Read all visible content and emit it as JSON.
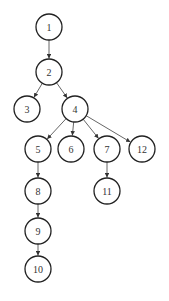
{
  "diagram": {
    "type": "tree",
    "node_radius": 13,
    "colors": {
      "stroke": "#222222",
      "edge": "#555555",
      "text": "#333333",
      "background": "#ffffff"
    },
    "nodes": [
      {
        "id": "1",
        "label": "1",
        "x": 49,
        "y": 27
      },
      {
        "id": "2",
        "label": "2",
        "x": 49,
        "y": 72
      },
      {
        "id": "3",
        "label": "3",
        "x": 27,
        "y": 109
      },
      {
        "id": "4",
        "label": "4",
        "x": 75,
        "y": 109
      },
      {
        "id": "5",
        "label": "5",
        "x": 38,
        "y": 149
      },
      {
        "id": "6",
        "label": "6",
        "x": 71,
        "y": 149
      },
      {
        "id": "7",
        "label": "7",
        "x": 107,
        "y": 149
      },
      {
        "id": "12",
        "label": "12",
        "x": 142,
        "y": 149
      },
      {
        "id": "8",
        "label": "8",
        "x": 38,
        "y": 191
      },
      {
        "id": "11",
        "label": "11",
        "x": 107,
        "y": 191
      },
      {
        "id": "9",
        "label": "9",
        "x": 38,
        "y": 231
      },
      {
        "id": "10",
        "label": "10",
        "x": 38,
        "y": 269
      }
    ],
    "edges": [
      [
        "1",
        "2"
      ],
      [
        "2",
        "3"
      ],
      [
        "2",
        "4"
      ],
      [
        "4",
        "5"
      ],
      [
        "4",
        "6"
      ],
      [
        "4",
        "7"
      ],
      [
        "4",
        "12"
      ],
      [
        "5",
        "8"
      ],
      [
        "7",
        "11"
      ],
      [
        "8",
        "9"
      ],
      [
        "9",
        "10"
      ]
    ]
  }
}
